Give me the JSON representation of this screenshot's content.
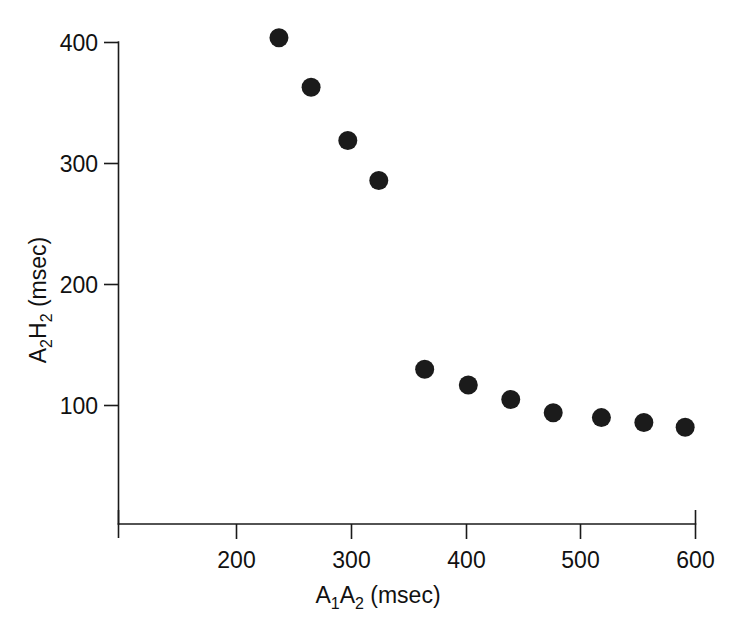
{
  "chart_data": {
    "type": "scatter",
    "title": "",
    "xlabel": "A1A2 (msec)",
    "ylabel": "A2H2 (msec)",
    "xlabel_parts": {
      "a": "A",
      "sub1": "1",
      "b": "A",
      "sub2": "2",
      "unit": " (msec)"
    },
    "ylabel_parts": {
      "a": "A",
      "sub1": "2",
      "b": "H",
      "sub2": "2",
      "unit": " (msec)"
    },
    "xlim": [
      115,
      615
    ],
    "ylim": [
      0,
      435
    ],
    "x_ticks": [
      200,
      300,
      400,
      500,
      600
    ],
    "x_tick_labels": [
      "200",
      "300",
      "400",
      "500",
      "600"
    ],
    "y_ticks": [
      100,
      200,
      300,
      400
    ],
    "y_tick_labels": [
      "100",
      "200",
      "300",
      "400"
    ],
    "grid": false,
    "legend": null,
    "marker": "filled-circle",
    "marker_color": "#1b1b1b",
    "marker_size_px": 19,
    "x": [
      237,
      265,
      297,
      324,
      364,
      402,
      439,
      476,
      518,
      555,
      591
    ],
    "y": [
      404,
      363,
      319,
      286,
      130,
      117,
      105,
      94,
      90,
      86,
      82
    ],
    "points": [
      {
        "x": 237,
        "y": 404
      },
      {
        "x": 265,
        "y": 363
      },
      {
        "x": 297,
        "y": 319
      },
      {
        "x": 324,
        "y": 286
      },
      {
        "x": 364,
        "y": 130
      },
      {
        "x": 402,
        "y": 117
      },
      {
        "x": 439,
        "y": 105
      },
      {
        "x": 476,
        "y": 94
      },
      {
        "x": 518,
        "y": 90
      },
      {
        "x": 555,
        "y": 86
      },
      {
        "x": 591,
        "y": 82
      }
    ]
  },
  "axes": {
    "x_axis_name": "x-axis",
    "y_axis_name": "y-axis"
  }
}
